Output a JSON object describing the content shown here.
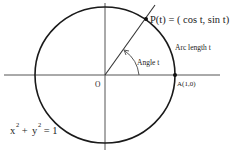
{
  "diagram": {
    "type": "unit-circle",
    "labels": {
      "point_p": "P(t) = ( cos t, sin t)",
      "arc_length": "Arc length t",
      "angle": "Angle t",
      "origin": "O",
      "point_a": "A(1,0)",
      "equation_x": "x",
      "equation_plus": " + ",
      "equation_y": "y",
      "equation_exp": "2",
      "equation_rhs": " = 1"
    },
    "colors": {
      "stroke": "#1a1a1a",
      "axis": "#555555",
      "text": "#222222",
      "background": "#ffffff"
    }
  }
}
